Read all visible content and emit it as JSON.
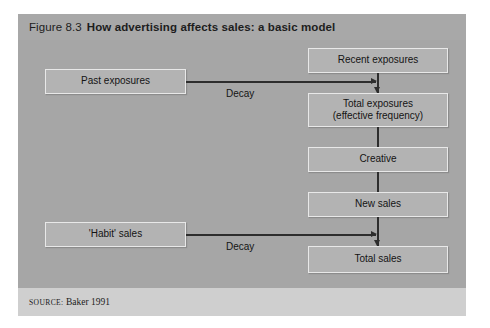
{
  "figure": {
    "number": "Figure 8.3",
    "title": "How advertising affects sales: a basic model",
    "source_label": "SOURCE:",
    "source_text": "Baker 1991"
  },
  "diagram": {
    "type": "flowchart",
    "nodes": [
      {
        "id": "recent-exposures",
        "label": "Recent exposures",
        "column": "right",
        "order": 1
      },
      {
        "id": "total-exposures",
        "label_line1": "Total exposures",
        "label_line2": "(effective frequency)",
        "column": "right",
        "order": 2
      },
      {
        "id": "creative",
        "label": "Creative",
        "column": "right",
        "order": 3
      },
      {
        "id": "new-sales",
        "label": "New sales",
        "column": "right",
        "order": 4
      },
      {
        "id": "total-sales",
        "label": "Total sales",
        "column": "right",
        "order": 5
      },
      {
        "id": "past-exposures",
        "label": "Past exposures",
        "column": "left",
        "order": 1
      },
      {
        "id": "habit-sales",
        "label": "'Habit' sales",
        "column": "left",
        "order": 2
      }
    ],
    "edges": [
      {
        "from": "recent-exposures",
        "to": "total-exposures",
        "label": "",
        "direction": "down"
      },
      {
        "from": "past-exposures",
        "to": "total-exposures",
        "label": "Decay",
        "direction": "right"
      },
      {
        "from": "total-exposures",
        "to": "creative",
        "label": "",
        "direction": "down"
      },
      {
        "from": "creative",
        "to": "new-sales",
        "label": "",
        "direction": "down"
      },
      {
        "from": "new-sales",
        "to": "total-sales",
        "label": "",
        "direction": "down"
      },
      {
        "from": "habit-sales",
        "to": "total-sales",
        "label": "Decay",
        "direction": "right"
      }
    ],
    "edge_labels": {
      "decay_top": "Decay",
      "decay_bottom": "Decay"
    }
  },
  "colors": {
    "panel_background": "#c9c9c9",
    "title_band": "#a8a8a8",
    "canvas": "#a6a6a6",
    "source_strip": "#cfcfcf",
    "node_fill": "#b3b3b3",
    "node_border": "#e8e8e8",
    "connector": "#2d2d2d",
    "text": "#141414"
  }
}
